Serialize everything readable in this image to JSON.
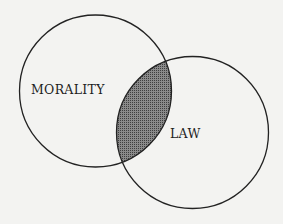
{
  "diagram": {
    "type": "venn",
    "sets": [
      {
        "label": "MORALITY",
        "cx": 95.5,
        "cy": 91,
        "r": 76
      },
      {
        "label": "LAW",
        "cx": 192.5,
        "cy": 132.5,
        "r": 76
      }
    ],
    "overlap_fill": "#6b6b6b",
    "stroke": "#222222",
    "background": "#f3f3f1"
  }
}
